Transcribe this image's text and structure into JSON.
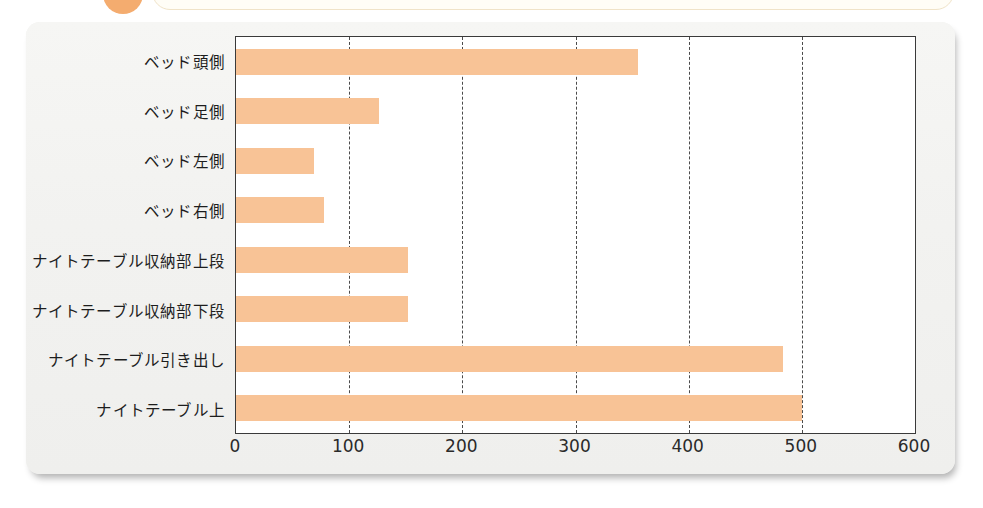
{
  "header": {
    "badge_icon": "orange-circle-badge",
    "title_box": ""
  },
  "chart_data": {
    "type": "bar",
    "orientation": "horizontal",
    "title": "",
    "subtitle": "",
    "xlabel": "",
    "ylabel": "",
    "categories": [
      "ベッド頭側",
      "ベッド足側",
      "ベッド左側",
      "ベッド右側",
      "ナイトテーブル収納部上段",
      "ナイトテーブル収納部下段",
      "ナイトテーブル引き出し",
      "ナイトテーブル上"
    ],
    "values": [
      355,
      126,
      69,
      78,
      152,
      152,
      483,
      500
    ],
    "xlim": [
      0,
      600
    ],
    "ylim": null,
    "xticks": [
      0,
      100,
      200,
      300,
      400,
      500,
      600
    ],
    "xtick_labels": [
      "0",
      "100",
      "200",
      "300",
      "400",
      "500",
      "600"
    ],
    "grid": "vertical-dashed",
    "legend": null,
    "legend_position": "none",
    "bar_color": "#f8c396",
    "axis_color": "#3a3a3a",
    "plot_background": "#ffffff",
    "card_background": "#f3f3f1"
  }
}
